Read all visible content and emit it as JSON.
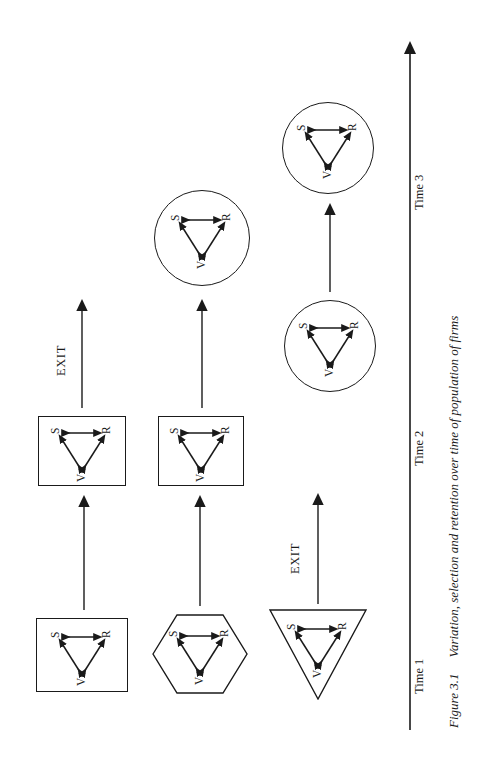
{
  "figure": {
    "caption_number": "Figure 3.1",
    "caption_text": "Variation, selection and retention over time of population of firms",
    "vsr_labels": {
      "variation": "V",
      "selection": "S",
      "retention": "R"
    },
    "ink_color": "#1a1a1a",
    "background_color": "#ffffff"
  },
  "time_axis": {
    "label": "",
    "ticks": [
      {
        "label": "Time 1"
      },
      {
        "label": "Time 2"
      },
      {
        "label": "Time 3"
      }
    ]
  },
  "exits": [
    {
      "label": "EXIT"
    },
    {
      "label": "EXIT"
    }
  ],
  "columns": [
    {
      "time": "Time 1",
      "firms": [
        {
          "shape": "square",
          "labels": [
            "V",
            "S",
            "R"
          ]
        },
        {
          "shape": "hexagon",
          "labels": [
            "V",
            "S",
            "R"
          ]
        },
        {
          "shape": "triangle",
          "labels": [
            "V",
            "S",
            "R"
          ]
        }
      ]
    },
    {
      "time": "Time 2",
      "firms": [
        {
          "shape": "square",
          "labels": [
            "V",
            "S",
            "R"
          ]
        },
        {
          "shape": "square",
          "labels": [
            "V",
            "S",
            "R"
          ]
        },
        {
          "shape": "circle",
          "labels": [
            "V",
            "S",
            "R"
          ]
        }
      ]
    },
    {
      "time": "Time 3",
      "firms": [
        {
          "shape": "circle",
          "labels": [
            "V",
            "S",
            "R"
          ]
        },
        {
          "shape": "circle",
          "labels": [
            "V",
            "S",
            "R"
          ]
        }
      ]
    }
  ],
  "transitions": [
    {
      "from": "t1-square",
      "to": "t2-square-top"
    },
    {
      "from": "t1-hexagon",
      "to": "t2-square-mid"
    },
    {
      "from": "t1-triangle",
      "to": "exit-1"
    },
    {
      "from": "t2-square-top",
      "to": "exit-2"
    },
    {
      "from": "t2-square-mid",
      "to": "t3-circle-top"
    },
    {
      "from": "t2-circle",
      "to": "t3-circle-bottom"
    }
  ]
}
